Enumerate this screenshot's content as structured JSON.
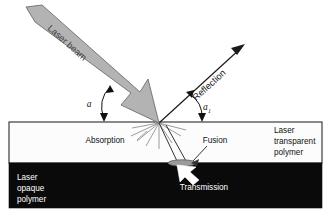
{
  "figure": {
    "background_color": "#ffffff"
  },
  "colors": {
    "beam_fill": "#b3b3b3",
    "beam_stroke": "#6e6e6e",
    "opaque_layer": "#0a0a0a",
    "transparent_layer": "#fcfcfc",
    "layer_border": "#2b2b2b",
    "ray_gray": "#8a8a8a",
    "ray_dark": "#333333",
    "fusion_fill": "#9a9a9a",
    "text_dark": "#111111",
    "text_light": "#ffffff"
  },
  "labels": {
    "laser_beam": "Laser beam",
    "reflection": "Reflection",
    "absorption": "Absorption",
    "fusion": "Fusion",
    "transmission": "Transmission",
    "angle_incidence": "a",
    "angle_reflection": "a",
    "angle_reflection_subscript": "1",
    "transparent_polymer_line1": "Laser",
    "transparent_polymer_line2": "transparent",
    "transparent_polymer_line3": "polymer",
    "opaque_polymer_line1": "Laser",
    "opaque_polymer_line2": "opaque",
    "opaque_polymer_line3": "polymer"
  },
  "geometry": {
    "impact_point_x": 159,
    "impact_point_y": 123,
    "transparent_layer_top": 122,
    "transparent_layer_bottom": 163,
    "opaque_layer_top": 163,
    "opaque_layer_bottom": 208,
    "fusion_ellipse_cx": 182,
    "fusion_ellipse_cy": 163,
    "fusion_ellipse_rx": 14,
    "fusion_ellipse_ry": 3
  }
}
